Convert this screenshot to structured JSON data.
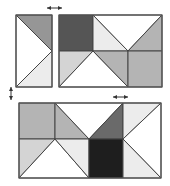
{
  "colors": {
    "white": "#ffffff",
    "very_light": "#ececec",
    "light": "#d4d4d4",
    "medium_light": "#b4b4b4",
    "medium": "#969696",
    "dark": "#6a6a6a",
    "darker": "#555555",
    "black": "#1e1e1e",
    "line": "#444444"
  },
  "figure": {
    "pieces": {
      "top_left_strip": {
        "bounds": [
          16,
          15,
          52,
          87
        ],
        "triangles": [
          {
            "points": "16,15 52,15 52,51",
            "shade": "medium"
          },
          {
            "points": "16,15 52,51 16,87",
            "shade": "white"
          },
          {
            "points": "52,51 52,87 16,87",
            "shade": "very_light"
          }
        ]
      },
      "top_right_block": {
        "bounds": [
          59,
          15,
          162,
          87
        ],
        "cells": [
          {
            "points": "59,15 93,15 93,51 59,51",
            "shade": "darker"
          },
          {
            "points": "93,15 93,51 128,51",
            "shade": "very_light"
          },
          {
            "points": "93,15 128,15 162,15 128,51",
            "shade": "white"
          },
          {
            "points": "128,51 162,15 162,51",
            "shade": "medium_light"
          },
          {
            "points": "59,51 93,51 59,87",
            "shade": "light"
          },
          {
            "points": "93,51 59,87 128,87",
            "shade": "white"
          },
          {
            "points": "93,51 128,51 128,87",
            "shade": "medium_light"
          },
          {
            "points": "128,51 162,51 162,87 128,87",
            "shade": "medium_light"
          }
        ]
      },
      "bottom_block": {
        "bounds": [
          19,
          103,
          161,
          178
        ],
        "cells": [
          {
            "points": "19,103 55,103 55,139 19,139",
            "shade": "medium_light"
          },
          {
            "points": "55,103 55,139 89,139",
            "shade": "medium_light"
          },
          {
            "points": "55,103 123,103 89,139",
            "shade": "white"
          },
          {
            "points": "89,139 123,103 123,139",
            "shade": "dark"
          },
          {
            "points": "123,103 161,103 123,139",
            "shade": "very_light"
          },
          {
            "points": "161,103 161,178 123,139",
            "shade": "white"
          },
          {
            "points": "19,139 55,139 19,178",
            "shade": "light"
          },
          {
            "points": "55,139 19,178 89,178",
            "shade": "white"
          },
          {
            "points": "55,139 89,139 89,178",
            "shade": "very_light"
          },
          {
            "points": "89,139 123,139 123,178 89,178",
            "shade": "black"
          },
          {
            "points": "123,139 123,178 161,178",
            "shade": "very_light"
          }
        ]
      }
    },
    "arrows": [
      {
        "name": "top-horizontal-double-arrow",
        "x1": 47,
        "y1": 8,
        "x2": 62,
        "y2": 8,
        "direction": "horizontal"
      },
      {
        "name": "left-vertical-double-arrow",
        "x1": 11,
        "y1": 87,
        "x2": 11,
        "y2": 100,
        "direction": "vertical"
      },
      {
        "name": "bottom-horizontal-double-arrow",
        "x1": 113,
        "y1": 97,
        "x2": 128,
        "y2": 97,
        "direction": "horizontal"
      }
    ]
  }
}
